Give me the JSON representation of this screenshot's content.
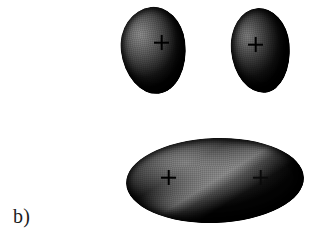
{
  "figure": {
    "panel_label": "b)",
    "background_color": "#ffffff",
    "width": 329,
    "height": 246
  },
  "shapes": [
    {
      "id": "blob-top-left",
      "name": "upper-left-ovoid",
      "kind": "ovoid",
      "marker": "+",
      "highlight_color": "#8e8e8e",
      "shadow_color": "#050505",
      "x": 121,
      "y": 7,
      "width": 65,
      "height": 87
    },
    {
      "id": "blob-top-right",
      "name": "upper-right-ovoid",
      "kind": "ovoid",
      "marker": "+",
      "highlight_color": "#7d7d7d",
      "shadow_color": "#040404",
      "x": 231,
      "y": 8,
      "width": 59,
      "height": 85
    },
    {
      "id": "blob-bottom",
      "name": "lower-ellipsoid",
      "kind": "ellipsoid",
      "marker": "+",
      "markers": 2,
      "highlight_color": "#8a8a8a",
      "shadow_color": "#040404",
      "x": 126,
      "y": 138,
      "width": 178,
      "height": 85
    }
  ],
  "markers": {
    "symbol": "+",
    "color": "#000000",
    "positions": [
      {
        "id": "plus-top-left",
        "x": 154,
        "y": 35
      },
      {
        "id": "plus-top-right",
        "x": 248,
        "y": 37
      },
      {
        "id": "plus-bottom-left",
        "x": 161,
        "y": 170
      },
      {
        "id": "plus-bottom-right",
        "x": 253,
        "y": 170
      }
    ]
  }
}
